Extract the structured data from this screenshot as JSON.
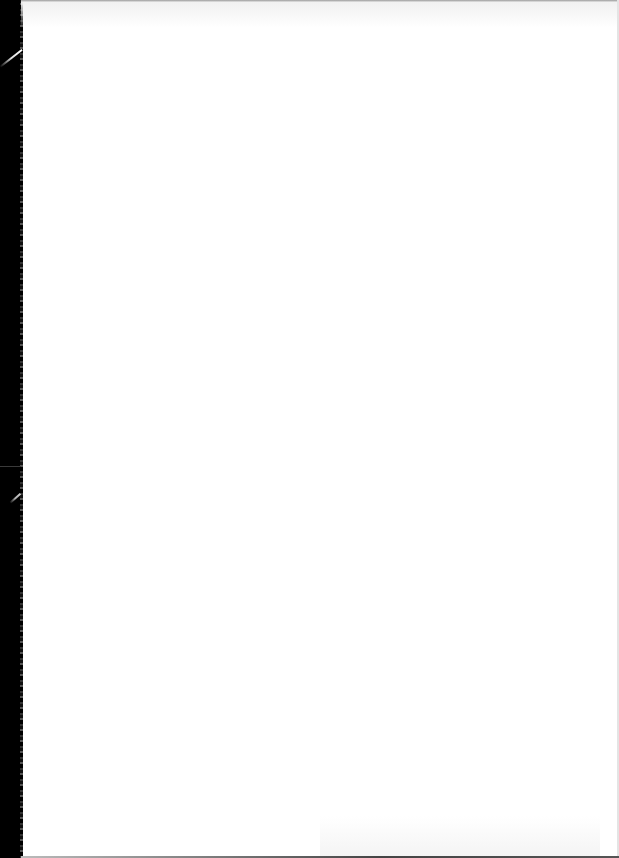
{
  "page": {
    "type": "scanned-blank-page",
    "background_color": "#ffffff",
    "scan_border_color": "#000000",
    "content": []
  }
}
